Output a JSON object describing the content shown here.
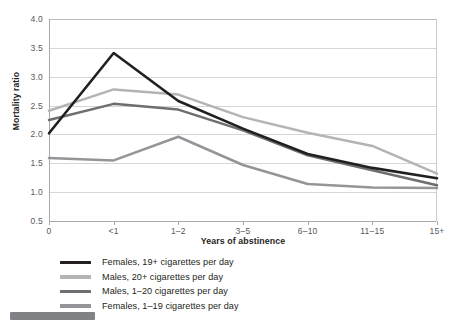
{
  "chart_data": {
    "type": "line",
    "title": "",
    "xlabel": "Years of abstinence",
    "ylabel": "Mortality ratio",
    "categories": [
      "0",
      "<1",
      "1–2",
      "3–5",
      "6–10",
      "11–15",
      "15+"
    ],
    "ylim": [
      0.5,
      4.0
    ],
    "ytick_labels": [
      "0.5",
      "1.0",
      "1.5",
      "2.0",
      "2.5",
      "3.0",
      "3.5",
      "4.0"
    ],
    "ytick_values": [
      0.5,
      1.0,
      1.5,
      2.0,
      2.5,
      3.0,
      3.5,
      4.0
    ],
    "grid": true,
    "legend_position": "below-plot",
    "series": [
      {
        "name": "Females, 19+ cigarettes per day",
        "color": "#231f20",
        "values": [
          2.02,
          3.41,
          2.58,
          2.1,
          1.66,
          1.42,
          1.24
        ]
      },
      {
        "name": "Males, 20+ cigarettes per day",
        "color": "#b2b4b6",
        "values": [
          2.41,
          2.78,
          2.69,
          2.3,
          2.03,
          1.8,
          1.32
        ]
      },
      {
        "name": "Males, 1–20 cigarettes per day",
        "color": "#6d6e71",
        "values": [
          2.25,
          2.53,
          2.43,
          2.07,
          1.64,
          1.38,
          1.12
        ]
      },
      {
        "name": "Females, 1–19 cigarettes per day",
        "color": "#939598",
        "values": [
          1.59,
          1.55,
          1.96,
          1.47,
          1.14,
          1.08,
          1.07
        ]
      }
    ]
  },
  "legend": {
    "items": [
      {
        "label": "Females, 19+ cigarettes per day",
        "color": "#231f20"
      },
      {
        "label": "Males, 20+ cigarettes per day",
        "color": "#b2b4b6"
      },
      {
        "label": "Males, 1–20 cigarettes per day",
        "color": "#6d6e71"
      },
      {
        "label": "Females, 1–19 cigarettes per day",
        "color": "#939598"
      }
    ]
  },
  "axes": {
    "y_title": "Mortality ratio",
    "x_title": "Years of abstinence"
  }
}
